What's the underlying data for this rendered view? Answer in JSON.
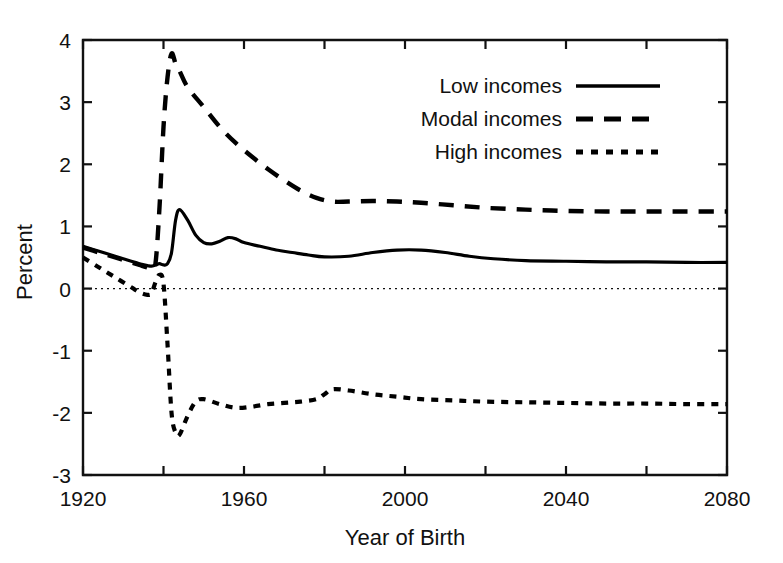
{
  "chart_data": {
    "type": "line",
    "title": "",
    "xlabel": "Year of Birth",
    "ylabel": "Percent",
    "xlim": [
      1920,
      2080
    ],
    "ylim": [
      -3,
      4
    ],
    "grid": false,
    "legend_position": "top-right",
    "xticks": [
      1920,
      1940,
      1960,
      1980,
      2000,
      2020,
      2040,
      2060,
      2080
    ],
    "xtick_labels": [
      "1920",
      "",
      "1960",
      "",
      "2000",
      "",
      "2040",
      "",
      "2080"
    ],
    "yticks": [
      -3,
      -2,
      -1,
      0,
      1,
      2,
      3,
      4
    ],
    "ytick_labels": [
      "-3",
      "-2",
      "-1",
      "0",
      "1",
      "2",
      "3",
      "4"
    ],
    "zero_reference_line": 0,
    "series": [
      {
        "name": "Low incomes",
        "style": "solid",
        "x": [
          1920,
          1924,
          1928,
          1932,
          1934,
          1936,
          1937,
          1938,
          1939,
          1940,
          1941,
          1942,
          1943,
          1944,
          1946,
          1948,
          1950,
          1952,
          1954,
          1956,
          1958,
          1960,
          1964,
          1968,
          1972,
          1976,
          1980,
          1986,
          1992,
          1998,
          2004,
          2010,
          2016,
          2022,
          2030,
          2040,
          2050,
          2060,
          2070,
          2080
        ],
        "values": [
          0.68,
          0.6,
          0.52,
          0.44,
          0.4,
          0.37,
          0.36,
          0.38,
          0.4,
          0.38,
          0.4,
          0.58,
          1.1,
          1.27,
          1.1,
          0.86,
          0.74,
          0.72,
          0.76,
          0.82,
          0.8,
          0.74,
          0.68,
          0.62,
          0.58,
          0.54,
          0.51,
          0.52,
          0.58,
          0.62,
          0.62,
          0.58,
          0.52,
          0.48,
          0.45,
          0.44,
          0.43,
          0.43,
          0.42,
          0.42
        ]
      },
      {
        "name": "Modal incomes",
        "style": "dashed",
        "x": [
          1920,
          1924,
          1928,
          1932,
          1934,
          1936,
          1937,
          1938,
          1939,
          1940,
          1941,
          1942,
          1943,
          1944,
          1946,
          1950,
          1954,
          1958,
          1962,
          1966,
          1970,
          1974,
          1978,
          1982,
          1986,
          1992,
          1998,
          2004,
          2012,
          2020,
          2030,
          2040,
          2050,
          2060,
          2070,
          2080
        ],
        "values": [
          0.66,
          0.58,
          0.5,
          0.42,
          0.38,
          0.34,
          0.33,
          0.4,
          1.3,
          2.6,
          3.4,
          3.78,
          3.62,
          3.5,
          3.24,
          2.92,
          2.6,
          2.34,
          2.12,
          1.92,
          1.74,
          1.58,
          1.46,
          1.4,
          1.4,
          1.41,
          1.4,
          1.38,
          1.34,
          1.3,
          1.27,
          1.25,
          1.24,
          1.24,
          1.24,
          1.24
        ]
      },
      {
        "name": "High incomes",
        "style": "dotted",
        "x": [
          1920,
          1924,
          1928,
          1932,
          1934,
          1936,
          1937,
          1938,
          1939,
          1940,
          1941,
          1942,
          1943,
          1944,
          1946,
          1948,
          1950,
          1954,
          1958,
          1962,
          1966,
          1970,
          1974,
          1978,
          1980,
          1982,
          1986,
          1992,
          1998,
          2004,
          2012,
          2020,
          2030,
          2040,
          2050,
          2060,
          2070,
          2080
        ],
        "values": [
          0.5,
          0.34,
          0.18,
          0.02,
          -0.06,
          -0.1,
          -0.08,
          0.1,
          0.22,
          0.08,
          -0.9,
          -2.0,
          -2.32,
          -2.35,
          -2.05,
          -1.82,
          -1.78,
          -1.86,
          -1.92,
          -1.9,
          -1.86,
          -1.84,
          -1.82,
          -1.78,
          -1.7,
          -1.62,
          -1.64,
          -1.7,
          -1.74,
          -1.78,
          -1.8,
          -1.82,
          -1.83,
          -1.84,
          -1.85,
          -1.85,
          -1.86,
          -1.86
        ]
      }
    ]
  },
  "legend": {
    "entries": [
      {
        "label": "Low incomes"
      },
      {
        "label": "Modal incomes"
      },
      {
        "label": "High incomes"
      }
    ]
  }
}
